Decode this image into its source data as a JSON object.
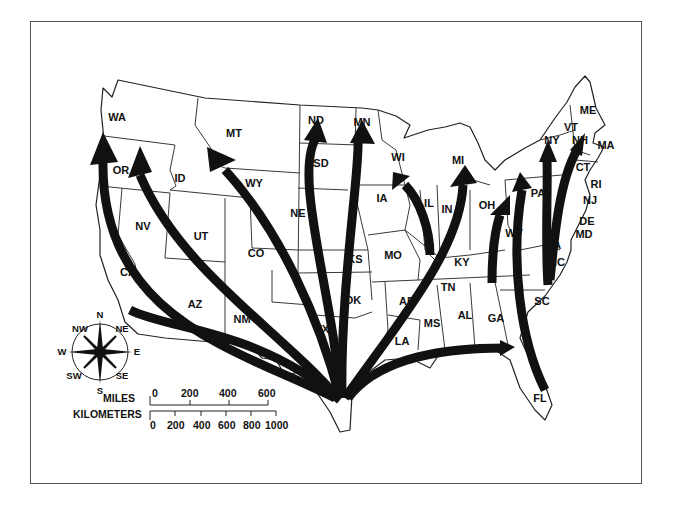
{
  "map": {
    "subject": "Migration arrows radiating from south Texas across the contiguous United States",
    "colors": {
      "ink": "#111111",
      "paper": "#ffffff",
      "frame": "#555555"
    },
    "states": [
      {
        "abbr": "WA",
        "x": 117,
        "y": 117
      },
      {
        "abbr": "OR",
        "x": 121,
        "y": 170
      },
      {
        "abbr": "CA",
        "x": 128,
        "y": 272
      },
      {
        "abbr": "NV",
        "x": 143,
        "y": 226
      },
      {
        "abbr": "ID",
        "x": 180,
        "y": 178
      },
      {
        "abbr": "MT",
        "x": 234,
        "y": 133
      },
      {
        "abbr": "WY",
        "x": 254,
        "y": 183
      },
      {
        "abbr": "UT",
        "x": 201,
        "y": 236
      },
      {
        "abbr": "CO",
        "x": 256,
        "y": 253
      },
      {
        "abbr": "AZ",
        "x": 195,
        "y": 304
      },
      {
        "abbr": "NM",
        "x": 242,
        "y": 319
      },
      {
        "abbr": "ND",
        "x": 316,
        "y": 120
      },
      {
        "abbr": "SD",
        "x": 321,
        "y": 163
      },
      {
        "abbr": "NE",
        "x": 298,
        "y": 213
      },
      {
        "abbr": "KS",
        "x": 355,
        "y": 259
      },
      {
        "abbr": "OK",
        "x": 353,
        "y": 300
      },
      {
        "abbr": "TX",
        "x": 322,
        "y": 329
      },
      {
        "abbr": "MN",
        "x": 362,
        "y": 122
      },
      {
        "abbr": "IA",
        "x": 382,
        "y": 198
      },
      {
        "abbr": "MO",
        "x": 393,
        "y": 255
      },
      {
        "abbr": "AR",
        "x": 407,
        "y": 301
      },
      {
        "abbr": "LA",
        "x": 402,
        "y": 341
      },
      {
        "abbr": "WI",
        "x": 398,
        "y": 157
      },
      {
        "abbr": "IL",
        "x": 429,
        "y": 203
      },
      {
        "abbr": "MI",
        "x": 458,
        "y": 160
      },
      {
        "abbr": "IN",
        "x": 447,
        "y": 209
      },
      {
        "abbr": "OH",
        "x": 487,
        "y": 205
      },
      {
        "abbr": "KY",
        "x": 462,
        "y": 262
      },
      {
        "abbr": "TN",
        "x": 448,
        "y": 287
      },
      {
        "abbr": "MS",
        "x": 432,
        "y": 323
      },
      {
        "abbr": "AL",
        "x": 465,
        "y": 315
      },
      {
        "abbr": "GA",
        "x": 496,
        "y": 318
      },
      {
        "abbr": "FL",
        "x": 540,
        "y": 398
      },
      {
        "abbr": "SC",
        "x": 542,
        "y": 301
      },
      {
        "abbr": "NC",
        "x": 557,
        "y": 262
      },
      {
        "abbr": "VA",
        "x": 554,
        "y": 245
      },
      {
        "abbr": "WV",
        "x": 514,
        "y": 233
      },
      {
        "abbr": "PA",
        "x": 538,
        "y": 193
      },
      {
        "abbr": "NY",
        "x": 552,
        "y": 140
      },
      {
        "abbr": "VT",
        "x": 571,
        "y": 127
      },
      {
        "abbr": "NH",
        "x": 580,
        "y": 140
      },
      {
        "abbr": "ME",
        "x": 588,
        "y": 110
      },
      {
        "abbr": "MA",
        "x": 606,
        "y": 145
      },
      {
        "abbr": "CT",
        "x": 583,
        "y": 167
      },
      {
        "abbr": "RI",
        "x": 596,
        "y": 184
      },
      {
        "abbr": "NJ",
        "x": 590,
        "y": 200
      },
      {
        "abbr": "DE",
        "x": 587,
        "y": 221
      },
      {
        "abbr": "MD",
        "x": 584,
        "y": 234
      }
    ],
    "arrows_from": "TX",
    "arrow_destinations": [
      "WA",
      "OR",
      "MT",
      "ND",
      "MN",
      "IA/WI",
      "MI",
      "OH",
      "FL/GA",
      "PA",
      "NY",
      "NH",
      "CA"
    ]
  },
  "compass": {
    "N": "N",
    "NE": "NE",
    "E": "E",
    "SE": "SE",
    "S": "S",
    "SW": "SW",
    "W": "W",
    "NW": "NW"
  },
  "scale": {
    "miles_label": "MILES",
    "miles_ticks": [
      "0",
      "200",
      "400",
      "600"
    ],
    "km_label": "KILOMETERS",
    "km_ticks": [
      "0",
      "200",
      "400",
      "600",
      "800",
      "1000"
    ]
  }
}
